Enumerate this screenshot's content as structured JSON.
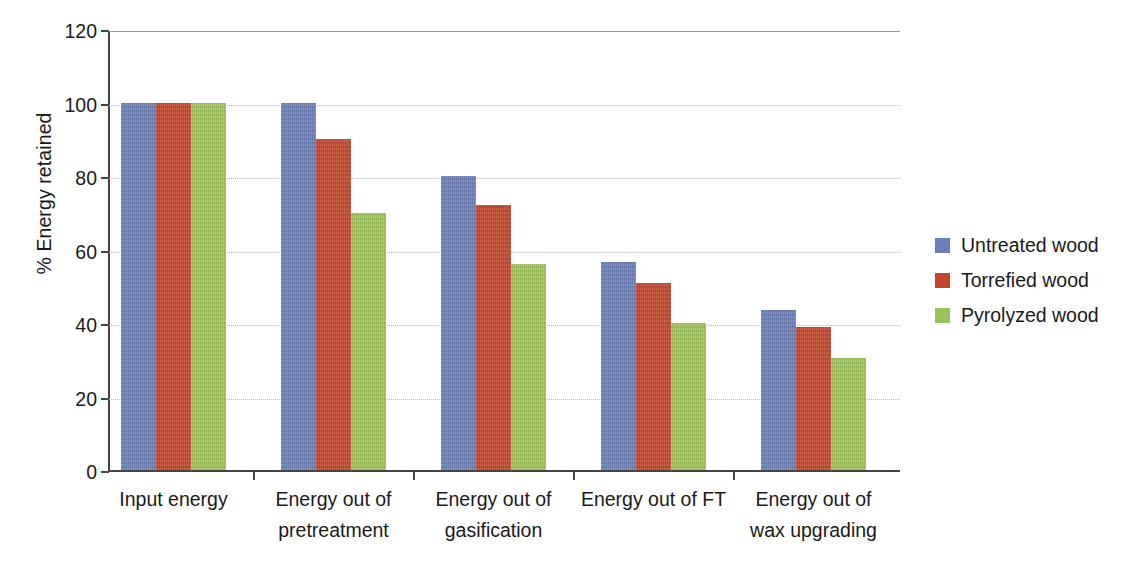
{
  "chart_data": {
    "type": "bar",
    "title": "",
    "xlabel": "",
    "ylabel": "% Energy retained",
    "ylim": [
      0,
      120
    ],
    "yticks": [
      0,
      20,
      40,
      60,
      80,
      100,
      120
    ],
    "ytick_labels": [
      "0",
      "20",
      "40",
      "60",
      "80",
      "100",
      "120"
    ],
    "grid": true,
    "legend_position": "right",
    "categories": [
      "Input energy",
      "Energy out of pretreatment",
      "Energy out of gasification",
      "Energy out of FT",
      "Energy out of wax upgrading"
    ],
    "category_lines": [
      [
        "Input energy",
        ""
      ],
      [
        "Energy out of",
        "pretreatment"
      ],
      [
        "Energy out of",
        "gasification"
      ],
      [
        "Energy out of FT",
        ""
      ],
      [
        "Energy out of",
        "wax upgrading"
      ]
    ],
    "series": [
      {
        "name": "Untreated wood",
        "color": "#6d7fb7",
        "values": [
          100,
          100,
          80,
          56.7,
          43.5
        ]
      },
      {
        "name": "Torrefied wood",
        "color": "#c2452c",
        "values": [
          100,
          90,
          72,
          51,
          39
        ]
      },
      {
        "name": "Pyrolyzed wood",
        "color": "#9dc25c",
        "values": [
          100,
          70,
          56,
          40,
          30.5
        ]
      }
    ]
  },
  "legend": {
    "items": [
      {
        "label": "Untreated wood",
        "color": "#6d7fb7"
      },
      {
        "label": "Torrefied wood",
        "color": "#c2452c"
      },
      {
        "label": "Pyrolyzed wood",
        "color": "#9dc25c"
      }
    ]
  }
}
